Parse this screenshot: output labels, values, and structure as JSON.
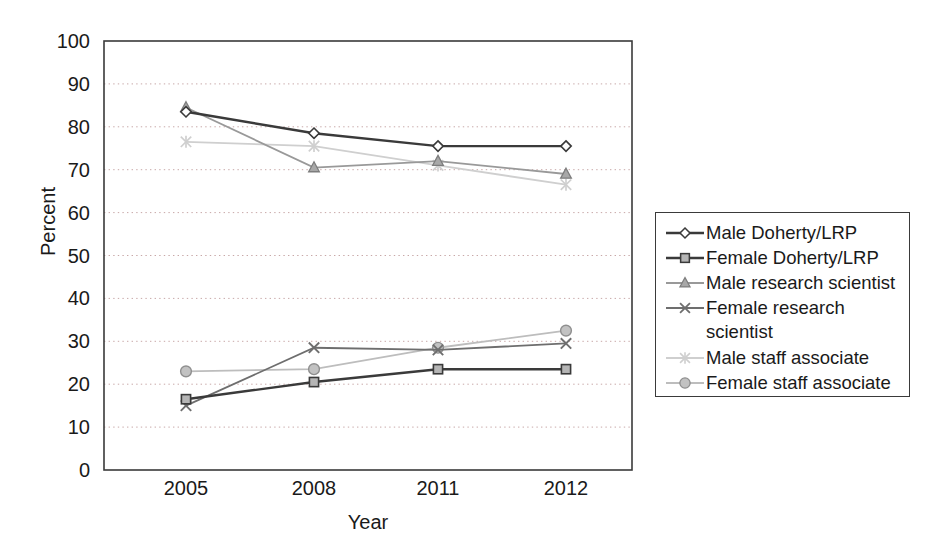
{
  "chart_data": {
    "type": "line",
    "title": "",
    "xlabel": "Year",
    "ylabel": "Percent",
    "categories": [
      "2005",
      "2008",
      "2011",
      "2012"
    ],
    "ylim": [
      0,
      100
    ],
    "ytick_step": 10,
    "yticks": [
      "0",
      "10",
      "20",
      "30",
      "40",
      "50",
      "60",
      "70",
      "80",
      "90",
      "100"
    ],
    "grid": "horizontal-dotted",
    "legend_position": "right-outside",
    "series": [
      {
        "name": "Male Doherty/LRP",
        "marker": "diamond",
        "color": "#3a3a3a",
        "values": [
          83.5,
          78.5,
          75.5,
          75.5
        ]
      },
      {
        "name": "Female Doherty/LRP",
        "marker": "square",
        "color": "#3a3a3a",
        "values": [
          16.5,
          20.5,
          23.5,
          23.5
        ]
      },
      {
        "name": "Male research scientist",
        "marker": "triangle",
        "color": "#999999",
        "values": [
          84.5,
          70.5,
          72.0,
          69.0
        ]
      },
      {
        "name": "Female research scientist",
        "marker": "cross",
        "color": "#6e6e6e",
        "values": [
          15.0,
          28.5,
          28.0,
          29.5
        ]
      },
      {
        "name": "Male staff associate",
        "marker": "asterisk",
        "color": "#cfcfcf",
        "values": [
          76.5,
          75.5,
          71.0,
          66.5
        ]
      },
      {
        "name": "Female staff associate",
        "marker": "circle",
        "color": "#bdbdbd",
        "values": [
          23.0,
          23.5,
          28.5,
          32.5
        ]
      }
    ]
  },
  "legend": {
    "entries": [
      {
        "label": "Male Doherty/LRP",
        "marker": "diamond"
      },
      {
        "label": "Female Doherty/LRP",
        "marker": "square"
      },
      {
        "label": "Male research scientist",
        "marker": "triangle"
      },
      {
        "label": "Female research",
        "label_cont": "scientist",
        "marker": "cross"
      },
      {
        "label": "Male staff associate",
        "marker": "asterisk"
      },
      {
        "label": "Female staff associate",
        "marker": "circle"
      }
    ]
  }
}
